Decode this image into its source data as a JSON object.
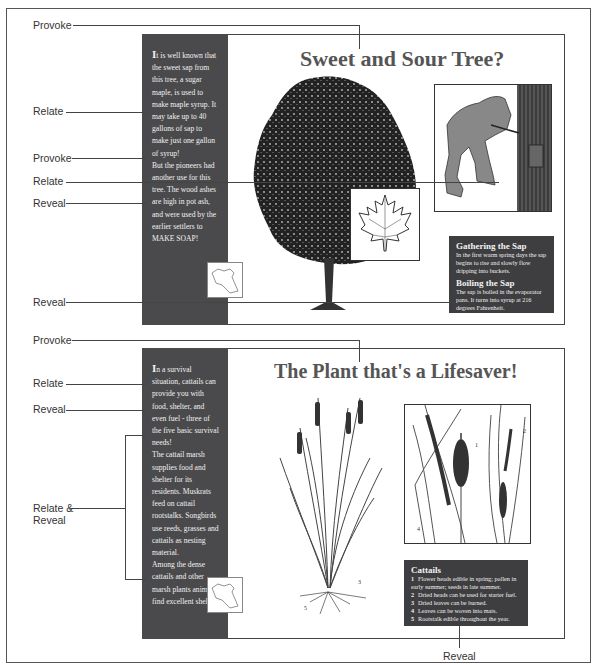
{
  "panel1": {
    "title": "Sweet and Sour Tree?",
    "sidebar": {
      "dropcap": "I",
      "paragraphs": [
        "t is well known that the sweet sap from this tree, a sugar maple, is used to make maple syrup. It may take up to 40 gallons of sap to make just one gallon of syrup!",
        "But the pioneers had another use for this tree. The wood ashes are high in pot ash, and were used by the earlier settlers to MAKE SOAP!"
      ]
    },
    "illustrations": {
      "tree": "sugar-maple-tree",
      "leaf": "maple-leaf",
      "tapping": "man-tapping-maple-tree"
    },
    "infobox": {
      "sections": [
        {
          "heading": "Gathering the Sap",
          "text": "In the first warm spring days the sap begins to rise and slowly flow dripping into buckets."
        },
        {
          "heading": "Boiling the Sap",
          "text": "The sap is boiled in the evaporator pans. It turns into syrup at 216 degrees Fahrenheit."
        }
      ]
    }
  },
  "panel2": {
    "title": "The Plant that's a Lifesaver!",
    "sidebar": {
      "dropcap": "I",
      "paragraphs": [
        "n a survival situation, cattails can provide you with food, shelter, and even fuel - three of the five basic survival needs!",
        "The cattail marsh supplies food and shelter for its residents. Muskrats feed on cattail rootstalks. Songbirds use reeds, grasses and cattails as nesting material.",
        "Among the dense cattails and other marsh plants animals find excellent shelter."
      ]
    },
    "illustrations": {
      "plant": "cattail-plant-with-roots",
      "detail": "cattail-heads-detail",
      "plant_labels": [
        "3",
        "5"
      ],
      "detail_labels": [
        "1",
        "2",
        "4"
      ]
    },
    "infobox": {
      "heading": "Cattails",
      "items": [
        {
          "num": "1",
          "text": "Flower heads edible in spring; pollen in early summer; seeds in late summer."
        },
        {
          "num": "2",
          "text": "Dried heads can be used for starter fuel."
        },
        {
          "num": "3",
          "text": "Dried leaves can be burned."
        },
        {
          "num": "4",
          "text": "Leaves can be woven into mats."
        },
        {
          "num": "5",
          "text": "Rootstalk edible throughout the year."
        }
      ]
    }
  },
  "annotations": {
    "provoke_top": "Provoke",
    "relate_1": "Relate",
    "provoke_2": "Provoke",
    "relate_2": "Relate",
    "reveal_1": "Reveal",
    "reveal_2": "Reveal",
    "provoke_3": "Provoke",
    "relate_3": "Relate",
    "reveal_3": "Reveal",
    "relate_reveal_line1": "Relate &",
    "relate_reveal_line2": "Reveal",
    "reveal_bottom": "Reveal"
  },
  "colors": {
    "sidebar": "#4a4a4c",
    "infobox": "#3e3e40",
    "title": "#555555"
  }
}
